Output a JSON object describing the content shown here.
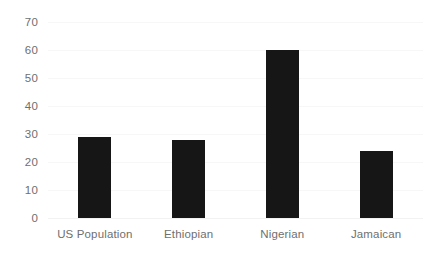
{
  "chart_data": {
    "type": "bar",
    "title": "",
    "subtitle": "",
    "xlabel": "",
    "ylabel": "",
    "categories": [
      "US Population",
      "Ethiopian",
      "Nigerian",
      "Jamaican"
    ],
    "values": [
      29,
      28,
      60,
      24
    ],
    "series": [
      {
        "name": "",
        "values": [
          29,
          28,
          60,
          24
        ]
      }
    ],
    "ylim": [
      0,
      70
    ],
    "ytick_labels": [
      "0",
      "10",
      "20",
      "30",
      "40",
      "50",
      "60",
      "70"
    ],
    "ytick_values": [
      0,
      10,
      20,
      30,
      40,
      50,
      60,
      70
    ],
    "grid": true,
    "grid_axis": "y",
    "legend": false,
    "legend_position": "none",
    "annotations": [],
    "colors": {
      "bar": "#161616",
      "gridline": "#f7f7f7",
      "baseline": "#f2f2f2",
      "tick_label": "#6f6f6f",
      "background": "#ffffff"
    }
  }
}
